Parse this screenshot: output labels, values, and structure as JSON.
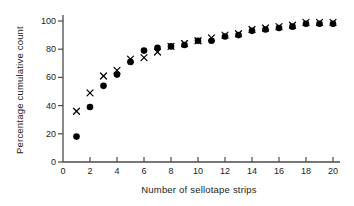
{
  "chart_data": {
    "type": "scatter",
    "title": "",
    "xlabel": "Number of sellotape strips",
    "ylabel": "Percentage cumulative count",
    "xlim": [
      0,
      20.6
    ],
    "ylim": [
      0,
      108
    ],
    "grid": false,
    "legend": "none",
    "xticks": [
      0,
      2,
      4,
      6,
      8,
      10,
      12,
      14,
      16,
      18,
      20
    ],
    "xtick_labels": [
      "0",
      "2",
      "4",
      "6",
      "8",
      "10",
      "12",
      "14",
      "16",
      "18",
      "20"
    ],
    "yticks": [
      0,
      20,
      40,
      60,
      80,
      100
    ],
    "ytick_labels": [
      "0",
      "20",
      "40",
      "60",
      "80",
      "100"
    ],
    "x": [
      1,
      2,
      3,
      4,
      5,
      6,
      7,
      8,
      9,
      10,
      11,
      12,
      13,
      14,
      15,
      16,
      17,
      18,
      19,
      20
    ],
    "series": [
      {
        "name": "filled-circle-series",
        "marker": "filled-circle",
        "color": "#000000",
        "values": [
          18,
          39,
          54,
          62,
          71,
          79,
          81,
          82,
          83,
          86,
          86,
          89,
          90,
          93,
          94,
          95,
          96,
          98,
          98,
          98
        ]
      },
      {
        "name": "cross-series",
        "marker": "x",
        "color": "#000000",
        "values": [
          36,
          49,
          61,
          65,
          73,
          74,
          78,
          82,
          84,
          86,
          88,
          90,
          91,
          94,
          95,
          96,
          97,
          99,
          99,
          99
        ]
      }
    ]
  },
  "axes": {
    "x_axis_name": "x-axis",
    "y_axis_name": "y-axis"
  }
}
